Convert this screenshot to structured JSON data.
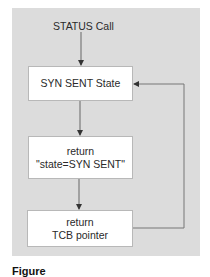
{
  "diagram": {
    "type": "flowchart",
    "start_label": "STATUS Call",
    "nodes": [
      {
        "id": "syn-sent-state",
        "lines": [
          "SYN SENT State"
        ]
      },
      {
        "id": "return-state",
        "lines": [
          "return",
          "\"state=SYN SENT\""
        ]
      },
      {
        "id": "return-tcb",
        "lines": [
          "return",
          "TCB pointer"
        ]
      }
    ],
    "edges": [
      {
        "from": "STATUS Call",
        "to": "syn-sent-state"
      },
      {
        "from": "syn-sent-state",
        "to": "return-state"
      },
      {
        "from": "return-state",
        "to": "return-tcb"
      },
      {
        "from": "return-tcb",
        "to": "syn-sent-state",
        "style": "loop-right"
      }
    ],
    "colors": {
      "panel": "#dcdcdc",
      "box": "#ffffff",
      "line": "#555555"
    }
  },
  "caption": {
    "text": "Figure"
  }
}
